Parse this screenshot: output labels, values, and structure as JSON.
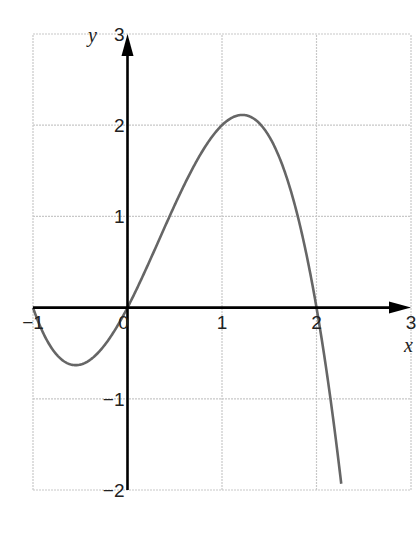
{
  "chart_data": {
    "type": "line",
    "title": "",
    "xlabel": "x",
    "ylabel": "y",
    "xlim": [
      -1,
      3
    ],
    "ylim": [
      -2,
      3
    ],
    "grid": true,
    "x_ticks": [
      "−1",
      "0",
      "1",
      "2",
      "3"
    ],
    "y_ticks": [
      "3",
      "2",
      "1",
      "−1",
      "−2"
    ],
    "series": [
      {
        "name": "curve",
        "function": "y = x(x+1)(2-x)",
        "x": [
          -1,
          -0.75,
          -0.55,
          -0.25,
          0,
          0.25,
          0.5,
          0.75,
          1,
          1.22,
          1.5,
          1.75,
          2,
          2.1,
          2.2,
          2.25
        ],
        "y": [
          0,
          -0.52,
          -0.63,
          -0.42,
          0,
          0.55,
          1.13,
          1.64,
          2,
          2.11,
          1.88,
          1.2,
          0,
          -0.65,
          -1.39,
          -1.83
        ]
      }
    ],
    "key_points": {
      "roots": [
        -1,
        0,
        2
      ],
      "local_max": {
        "x": 1.22,
        "y": 2.11
      },
      "local_min": {
        "x": -0.55,
        "y": -0.63
      }
    },
    "colors": {
      "curve": "#666666",
      "axes": "#000000",
      "grid": "#c8c8c8"
    }
  }
}
